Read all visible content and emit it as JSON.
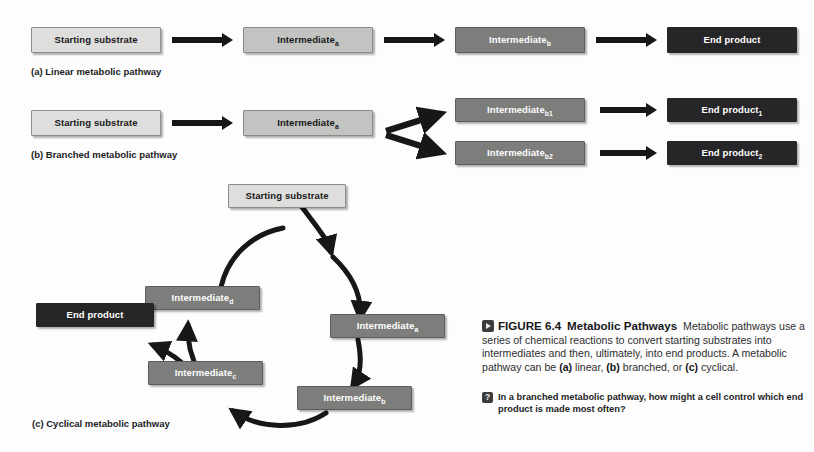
{
  "figure": {
    "number": "FIGURE 6.4",
    "title": "Metabolic Pathways",
    "body": "Metabolic pathways use a series of chemical reactions to convert starting substrates into intermediates and then, ultimately, into end products. A metabolic pathway can be (a) linear, (b) branched, or (c) cyclical.",
    "media_icon": "play-video-icon",
    "question_icon": "question-mark-icon",
    "question": "In a branched metabolic pathway, how might a cell control which end product is made most often?"
  },
  "colors": {
    "page_background": "#fdfdfd",
    "tone_light": "#dededc",
    "tone_mid": "#c3c3c1",
    "tone_dark": "#7d7d7b",
    "tone_black": "#262628",
    "arrow": "#17171a",
    "text_dark": "#18181a",
    "text_light": "#ffffff"
  },
  "panels": [
    {
      "key": "a",
      "label": "(a) Linear metabolic pathway",
      "type": "linear",
      "nodes": [
        {
          "id": "a-substrate",
          "text": "Starting substrate",
          "sub": "",
          "tone": "light"
        },
        {
          "id": "a-intermediate-a",
          "text": "Intermediate",
          "sub": "a",
          "tone": "mid"
        },
        {
          "id": "a-intermediate-b",
          "text": "Intermediate",
          "sub": "b",
          "tone": "dark"
        },
        {
          "id": "a-end-product",
          "text": "End product",
          "sub": "",
          "tone": "black"
        }
      ]
    },
    {
      "key": "b",
      "label": "(b) Branched metabolic pathway",
      "type": "branched",
      "nodes": [
        {
          "id": "b-substrate",
          "text": "Starting substrate",
          "sub": "",
          "tone": "light"
        },
        {
          "id": "b-intermediate-a",
          "text": "Intermediate",
          "sub": "a",
          "tone": "mid"
        },
        {
          "id": "b-intermediate-b1",
          "text": "Intermediate",
          "sub": "b1",
          "tone": "dark"
        },
        {
          "id": "b-intermediate-b2",
          "text": "Intermediate",
          "sub": "b2",
          "tone": "dark"
        },
        {
          "id": "b-end-product-1",
          "text": "End product",
          "sub": "1",
          "tone": "black"
        },
        {
          "id": "b-end-product-2",
          "text": "End product",
          "sub": "2",
          "tone": "black"
        }
      ]
    },
    {
      "key": "c",
      "label": "(c) Cyclical metabolic pathway",
      "type": "cyclical",
      "nodes": [
        {
          "id": "c-substrate",
          "text": "Starting substrate",
          "sub": "",
          "tone": "light"
        },
        {
          "id": "c-intermediate-a",
          "text": "Intermediate",
          "sub": "a",
          "tone": "dark"
        },
        {
          "id": "c-intermediate-b",
          "text": "Intermediate",
          "sub": "b",
          "tone": "dark"
        },
        {
          "id": "c-intermediate-c",
          "text": "Intermediate",
          "sub": "c",
          "tone": "dark"
        },
        {
          "id": "c-intermediate-d",
          "text": "Intermediate",
          "sub": "d",
          "tone": "dark"
        },
        {
          "id": "c-end-product",
          "text": "End product",
          "sub": "",
          "tone": "black"
        }
      ]
    }
  ]
}
